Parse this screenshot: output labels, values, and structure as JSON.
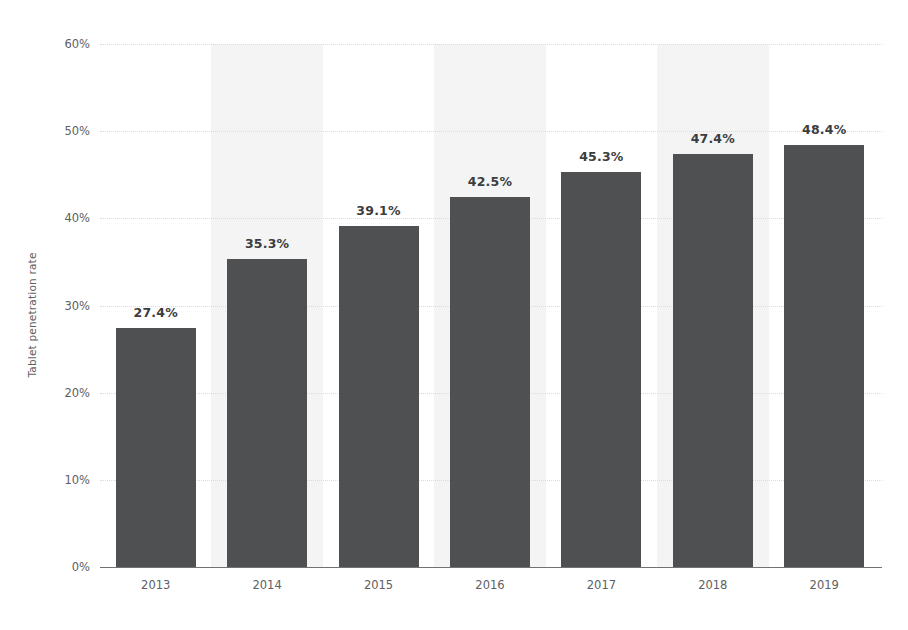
{
  "chart_data": {
    "type": "bar",
    "title": "",
    "xlabel": "",
    "ylabel": "Tablet penetration rate",
    "categories": [
      "2013",
      "2014",
      "2015",
      "2016",
      "2017",
      "2018",
      "2019"
    ],
    "values": [
      27.4,
      35.3,
      39.1,
      42.5,
      45.3,
      47.4,
      48.4
    ],
    "value_labels": [
      "27.4%",
      "35.3%",
      "39.1%",
      "42.5%",
      "45.3%",
      "47.4%",
      "48.4%"
    ],
    "ylim": [
      0,
      60
    ],
    "ytick_values": [
      0,
      10,
      20,
      30,
      40,
      50,
      60
    ],
    "ytick_labels": [
      "0%",
      "10%",
      "20%",
      "30%",
      "40%",
      "50%",
      "60%"
    ],
    "grid": true,
    "legend": "none",
    "alternating_band_categories": [
      "2014",
      "2016",
      "2018"
    ],
    "colors": {
      "bar": "#4f5052",
      "band": "#f4f4f4",
      "gridline": "#d9dbdc",
      "axis": "#6f7376",
      "tick_text": "#5d6063",
      "value_label_text": "#3b3d3f",
      "background": "#ffffff"
    }
  }
}
